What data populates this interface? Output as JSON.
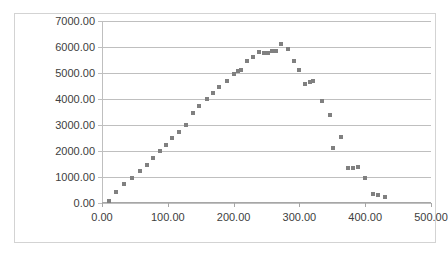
{
  "chart_data": {
    "type": "scatter",
    "title": "",
    "subtitle": "",
    "xlabel": "",
    "ylabel": "",
    "xlim": [
      0,
      500
    ],
    "ylim": [
      0,
      7000
    ],
    "xticks": [
      "0.00",
      "100.00",
      "200.00",
      "300.00",
      "400.00",
      "500.00"
    ],
    "xtick_values": [
      0,
      100,
      200,
      300,
      400,
      500
    ],
    "yticks": [
      "0.00",
      "1000.00",
      "2000.00",
      "3000.00",
      "4000.00",
      "5000.00",
      "6000.00",
      "7000.00"
    ],
    "ytick_values": [
      0,
      1000,
      2000,
      3000,
      4000,
      5000,
      6000,
      7000
    ],
    "grid": "horizontal",
    "legend": "none",
    "marker_color": "#808080",
    "marker_shape": "square",
    "gridline_color": "#bfbfbf",
    "axis_color": "#a6a6a6",
    "border_color": "#d3d3d3",
    "background_color": "#ffffff",
    "series": [
      {
        "name": "Series1",
        "points": [
          [
            10,
            90
          ],
          [
            22,
            440
          ],
          [
            34,
            720
          ],
          [
            46,
            975
          ],
          [
            58,
            1215
          ],
          [
            69,
            1450
          ],
          [
            78,
            1725
          ],
          [
            88,
            1990
          ],
          [
            97,
            2245
          ],
          [
            107,
            2495
          ],
          [
            117,
            2725
          ],
          [
            127,
            2985
          ],
          [
            138,
            3475
          ],
          [
            148,
            3745
          ],
          [
            160,
            4000
          ],
          [
            168,
            4225
          ],
          [
            178,
            4455
          ],
          [
            190,
            4700
          ],
          [
            200,
            4945
          ],
          [
            206,
            5070
          ],
          [
            212,
            5120
          ],
          [
            221,
            5445
          ],
          [
            230,
            5620
          ],
          [
            238,
            5810
          ],
          [
            246,
            5760
          ],
          [
            252,
            5765
          ],
          [
            258,
            5845
          ],
          [
            264,
            5855
          ],
          [
            272,
            6110
          ],
          [
            282,
            5915
          ],
          [
            292,
            5455
          ],
          [
            300,
            5100
          ],
          [
            309,
            4590
          ],
          [
            316,
            4650
          ],
          [
            321,
            4685
          ],
          [
            334,
            3905
          ],
          [
            347,
            3395
          ],
          [
            351,
            2125
          ],
          [
            363,
            2530
          ],
          [
            374,
            1360
          ],
          [
            382,
            1335
          ],
          [
            389,
            1380
          ],
          [
            400,
            965
          ],
          [
            412,
            340
          ],
          [
            420,
            305
          ],
          [
            430,
            245
          ]
        ]
      }
    ]
  }
}
